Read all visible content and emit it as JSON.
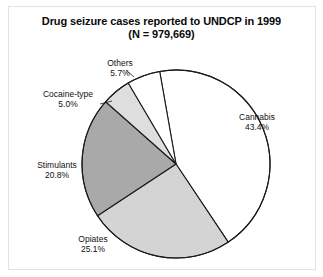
{
  "figure": {
    "title_line1": "Drug seizure cases reported to UNDCP in 1999",
    "title_line2": "(N = 979,669)",
    "frame_color": "#e2e2e2",
    "background": "#ffffff"
  },
  "chart_data": {
    "type": "pie",
    "title": "Drug seizure cases reported to UNDCP in 1999 (N = 979,669)",
    "subtitle": "(N = 979,669)",
    "total_n": 979669,
    "xlabel": "",
    "ylabel": "",
    "legend": "none",
    "grid": false,
    "start_angle_deg": -10,
    "direction": "clockwise",
    "units": "percent",
    "categories": [
      "Cannabis",
      "Opiates",
      "Stimulants",
      "Cocaine-type",
      "Others"
    ],
    "values": [
      43.4,
      25.1,
      20.8,
      5.0,
      5.7
    ],
    "slices": [
      {
        "label": "Cannabis",
        "value": 43.4,
        "value_text": "43.4%",
        "fill": "#ffffff",
        "stroke": "#1a1a1a",
        "label_pos": "right"
      },
      {
        "label": "Opiates",
        "value": 25.1,
        "value_text": "25.1%",
        "fill": "#d4d4d4",
        "stroke": "#1a1a1a",
        "label_pos": "bottom-left"
      },
      {
        "label": "Stimulants",
        "value": 20.8,
        "value_text": "20.8%",
        "fill": "#a9a9a9",
        "stroke": "#1a1a1a",
        "label_pos": "left"
      },
      {
        "label": "Cocaine-type",
        "value": 5.0,
        "value_text": "5.0%",
        "fill": "#dedede",
        "stroke": "#1a1a1a",
        "label_pos": "upper-left"
      },
      {
        "label": "Others",
        "value": 5.7,
        "value_text": "5.7%",
        "fill": "#ffffff",
        "stroke": "#1a1a1a",
        "label_pos": "top"
      }
    ]
  }
}
